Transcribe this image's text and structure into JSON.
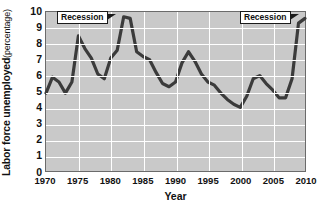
{
  "chart_data": {
    "type": "line",
    "title": "",
    "xlabel": "Year",
    "ylabel_bold": "Labor force unemployed",
    "ylabel_sub": "(percentage)",
    "xlim": [
      1970,
      2010
    ],
    "ylim": [
      0,
      10
    ],
    "xticks": [
      1970,
      1975,
      1980,
      1985,
      1990,
      1995,
      2000,
      2005,
      2010
    ],
    "yticks": [
      0,
      1,
      2,
      3,
      4,
      5,
      6,
      7,
      8,
      9,
      10
    ],
    "grid": true,
    "legend": "none",
    "series": [
      {
        "name": "Labor force unemployed",
        "color": "#3b3b3b",
        "x": [
          1970,
          1971,
          1972,
          1973,
          1974,
          1975,
          1976,
          1977,
          1978,
          1979,
          1980,
          1981,
          1982,
          1983,
          1984,
          1985,
          1986,
          1987,
          1988,
          1989,
          1990,
          1991,
          1992,
          1993,
          1994,
          1995,
          1996,
          1997,
          1998,
          1999,
          2000,
          2001,
          2002,
          2003,
          2004,
          2005,
          2006,
          2007,
          2008,
          2009,
          2010
        ],
        "values": [
          4.9,
          5.9,
          5.6,
          4.9,
          5.6,
          8.5,
          7.7,
          7.1,
          6.1,
          5.8,
          7.1,
          7.6,
          9.7,
          9.6,
          7.5,
          7.2,
          7.0,
          6.2,
          5.5,
          5.3,
          5.6,
          6.8,
          7.5,
          6.9,
          6.1,
          5.6,
          5.4,
          4.9,
          4.5,
          4.2,
          4.0,
          4.7,
          5.8,
          6.0,
          5.5,
          5.1,
          4.6,
          4.6,
          5.8,
          9.3,
          9.6
        ]
      }
    ],
    "annotations": [
      {
        "label": "Recession",
        "x": 1975,
        "y": 9.6,
        "left_px": 57,
        "top_px": 11
      },
      {
        "label": "Recession",
        "x": 2008,
        "y": 9.6,
        "left_px": 240,
        "top_px": 11
      }
    ]
  },
  "colors": {
    "plot_background": "#c9c9c9",
    "gridline": "#ffffff",
    "line": "#3b3b3b",
    "axis_border": "#6b6b6b",
    "text": "#111111",
    "annotation_box": "#ffffff"
  }
}
